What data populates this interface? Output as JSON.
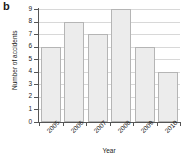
{
  "panel": {
    "letter": "b"
  },
  "chart_data": {
    "type": "bar",
    "title": "",
    "subtitle": "",
    "xlabel": "Year",
    "ylabel": "Number of accidents",
    "categories": [
      "2005",
      "2006",
      "2007",
      "2008",
      "2009",
      "2010"
    ],
    "values": [
      6,
      8,
      7,
      9,
      6,
      4
    ],
    "series": [
      {
        "name": "Number of accidents",
        "values": [
          6,
          8,
          7,
          9,
          6,
          4
        ]
      }
    ],
    "ylim": [
      0,
      9
    ],
    "xlim_categories": 6,
    "ytick_labels": [
      "0",
      "1",
      "2",
      "3",
      "4",
      "5",
      "6",
      "7",
      "8",
      "9"
    ],
    "ytick_values": [
      0,
      1,
      2,
      3,
      4,
      5,
      6,
      7,
      8,
      9
    ],
    "xtick_labels": [
      "2005",
      "2006",
      "2007",
      "2008",
      "2009",
      "2010"
    ],
    "grid": true,
    "grid_axis": "y",
    "legend": false,
    "legend_position": "none",
    "xtick_label_rotation": -45,
    "colors": {
      "bar_fill": "#ececec",
      "bar_edge": "#b5b5b5",
      "gridline": "#d8d8d8",
      "axis": "#555555",
      "text": "#1a1a1a",
      "background": "#ffffff"
    },
    "annotations": []
  }
}
